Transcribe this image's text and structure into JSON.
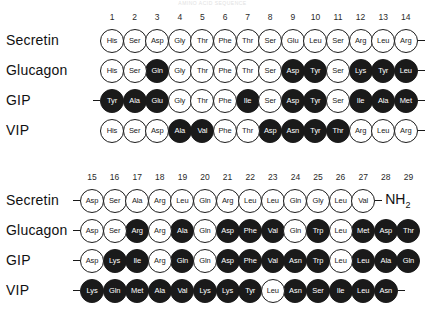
{
  "figure": {
    "faint_header": "AMINO ACID SEQUENCE",
    "circle_filled_color": "#1a1a1a",
    "circle_open_color": "#ffffff",
    "stroke_color": "#1c1c1c"
  },
  "panels": [
    {
      "id": "residues-1-14",
      "numbers": [
        "1",
        "2",
        "3",
        "4",
        "5",
        "6",
        "7",
        "8",
        "9",
        "10",
        "11",
        "12",
        "13",
        "14"
      ],
      "rows": [
        {
          "label": "Secretin",
          "lead_dash": false,
          "trail_dash": true,
          "terminus": "",
          "residues": [
            {
              "name": "His",
              "filled": false
            },
            {
              "name": "Ser",
              "filled": false
            },
            {
              "name": "Asp",
              "filled": false
            },
            {
              "name": "Gly",
              "filled": false
            },
            {
              "name": "Thr",
              "filled": false
            },
            {
              "name": "Phe",
              "filled": false
            },
            {
              "name": "Thr",
              "filled": false
            },
            {
              "name": "Ser",
              "filled": false
            },
            {
              "name": "Glu",
              "filled": false
            },
            {
              "name": "Leu",
              "filled": false
            },
            {
              "name": "Ser",
              "filled": false
            },
            {
              "name": "Arg",
              "filled": false
            },
            {
              "name": "Leu",
              "filled": false
            },
            {
              "name": "Arg",
              "filled": false
            }
          ]
        },
        {
          "label": "Glucagon",
          "lead_dash": false,
          "trail_dash": true,
          "terminus": "",
          "residues": [
            {
              "name": "His",
              "filled": false
            },
            {
              "name": "Ser",
              "filled": false
            },
            {
              "name": "Gln",
              "filled": true
            },
            {
              "name": "Gly",
              "filled": false
            },
            {
              "name": "Thr",
              "filled": false
            },
            {
              "name": "Phe",
              "filled": false
            },
            {
              "name": "Thr",
              "filled": false
            },
            {
              "name": "Ser",
              "filled": false
            },
            {
              "name": "Asp",
              "filled": true
            },
            {
              "name": "Tyr",
              "filled": true
            },
            {
              "name": "Ser",
              "filled": false
            },
            {
              "name": "Lys",
              "filled": true
            },
            {
              "name": "Tyr",
              "filled": true
            },
            {
              "name": "Leu",
              "filled": true
            }
          ]
        },
        {
          "label": "GIP",
          "lead_dash": true,
          "trail_dash": true,
          "terminus": "",
          "residues": [
            {
              "name": "Tyr",
              "filled": true
            },
            {
              "name": "Ala",
              "filled": true
            },
            {
              "name": "Glu",
              "filled": true
            },
            {
              "name": "Gly",
              "filled": false
            },
            {
              "name": "Thr",
              "filled": false
            },
            {
              "name": "Phe",
              "filled": false
            },
            {
              "name": "Ile",
              "filled": true
            },
            {
              "name": "Ser",
              "filled": false
            },
            {
              "name": "Asp",
              "filled": true
            },
            {
              "name": "Tyr",
              "filled": true
            },
            {
              "name": "Ser",
              "filled": false
            },
            {
              "name": "Ile",
              "filled": true
            },
            {
              "name": "Ala",
              "filled": true
            },
            {
              "name": "Met",
              "filled": true
            }
          ]
        },
        {
          "label": "VIP",
          "lead_dash": false,
          "trail_dash": true,
          "terminus": "",
          "residues": [
            {
              "name": "His",
              "filled": false
            },
            {
              "name": "Ser",
              "filled": false
            },
            {
              "name": "Asp",
              "filled": false
            },
            {
              "name": "Ala",
              "filled": true
            },
            {
              "name": "Val",
              "filled": true
            },
            {
              "name": "Phe",
              "filled": false
            },
            {
              "name": "Thr",
              "filled": false
            },
            {
              "name": "Asp",
              "filled": true
            },
            {
              "name": "Asn",
              "filled": true
            },
            {
              "name": "Tyr",
              "filled": true
            },
            {
              "name": "Thr",
              "filled": true
            },
            {
              "name": "Arg",
              "filled": false
            },
            {
              "name": "Leu",
              "filled": false
            },
            {
              "name": "Arg",
              "filled": false
            }
          ]
        }
      ]
    },
    {
      "id": "residues-15-29",
      "numbers": [
        "15",
        "16",
        "17",
        "18",
        "19",
        "20",
        "21",
        "22",
        "23",
        "24",
        "25",
        "26",
        "27",
        "28",
        "29"
      ],
      "rows": [
        {
          "label": "Secretin",
          "lead_dash": true,
          "trail_dash": false,
          "terminus": "NH2",
          "residues": [
            {
              "name": "Asp",
              "filled": false
            },
            {
              "name": "Ser",
              "filled": false
            },
            {
              "name": "Ala",
              "filled": false
            },
            {
              "name": "Arg",
              "filled": false
            },
            {
              "name": "Leu",
              "filled": false
            },
            {
              "name": "Gln",
              "filled": false
            },
            {
              "name": "Arg",
              "filled": false
            },
            {
              "name": "Leu",
              "filled": false
            },
            {
              "name": "Leu",
              "filled": false
            },
            {
              "name": "Gln",
              "filled": false
            },
            {
              "name": "Gly",
              "filled": false
            },
            {
              "name": "Leu",
              "filled": false
            },
            {
              "name": "Val",
              "filled": false
            }
          ]
        },
        {
          "label": "Glucagon",
          "lead_dash": true,
          "trail_dash": false,
          "terminus": "",
          "residues": [
            {
              "name": "Asp",
              "filled": false
            },
            {
              "name": "Ser",
              "filled": false
            },
            {
              "name": "Arg",
              "filled": true
            },
            {
              "name": "Arg",
              "filled": false
            },
            {
              "name": "Ala",
              "filled": true
            },
            {
              "name": "Gln",
              "filled": false
            },
            {
              "name": "Asp",
              "filled": true
            },
            {
              "name": "Phe",
              "filled": true
            },
            {
              "name": "Val",
              "filled": true
            },
            {
              "name": "Gln",
              "filled": false
            },
            {
              "name": "Trp",
              "filled": true
            },
            {
              "name": "Leu",
              "filled": false
            },
            {
              "name": "Met",
              "filled": true
            },
            {
              "name": "Asp",
              "filled": true
            },
            {
              "name": "Thr",
              "filled": true
            }
          ]
        },
        {
          "label": "GIP",
          "lead_dash": true,
          "trail_dash": false,
          "terminus": "",
          "residues": [
            {
              "name": "Asp",
              "filled": false
            },
            {
              "name": "Lys",
              "filled": true
            },
            {
              "name": "Ile",
              "filled": true
            },
            {
              "name": "Arg",
              "filled": false
            },
            {
              "name": "Gln",
              "filled": true
            },
            {
              "name": "Gln",
              "filled": false
            },
            {
              "name": "Asp",
              "filled": true
            },
            {
              "name": "Phe",
              "filled": true
            },
            {
              "name": "Val",
              "filled": true
            },
            {
              "name": "Asn",
              "filled": true
            },
            {
              "name": "Trp",
              "filled": true
            },
            {
              "name": "Leu",
              "filled": false
            },
            {
              "name": "Leu",
              "filled": true
            },
            {
              "name": "Ala",
              "filled": true
            },
            {
              "name": "Gln",
              "filled": true
            }
          ]
        },
        {
          "label": "VIP",
          "lead_dash": true,
          "trail_dash": true,
          "terminus": "",
          "residues": [
            {
              "name": "Lys",
              "filled": true
            },
            {
              "name": "Gln",
              "filled": true
            },
            {
              "name": "Met",
              "filled": true
            },
            {
              "name": "Ala",
              "filled": true
            },
            {
              "name": "Val",
              "filled": true
            },
            {
              "name": "Lys",
              "filled": true
            },
            {
              "name": "Lys",
              "filled": true
            },
            {
              "name": "Tyr",
              "filled": true
            },
            {
              "name": "Leu",
              "filled": false
            },
            {
              "name": "Asn",
              "filled": true
            },
            {
              "name": "Ser",
              "filled": true
            },
            {
              "name": "Ile",
              "filled": true
            },
            {
              "name": "Leu",
              "filled": true
            },
            {
              "name": "Asn",
              "filled": true
            }
          ]
        }
      ]
    }
  ]
}
